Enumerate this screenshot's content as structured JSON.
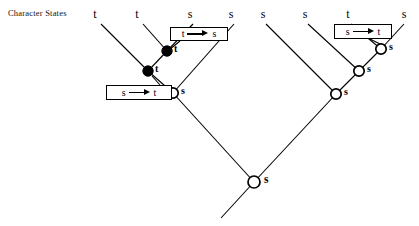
{
  "figure": {
    "width": 419,
    "height": 226,
    "background": "#ffffff",
    "line_color": "#000000",
    "node_filled_color": "#000000",
    "node_open_color": "#ffffff"
  },
  "row_label": {
    "text": "Character States",
    "x": 8,
    "y": 8
  },
  "tips": [
    {
      "id": "tip-1",
      "label": "t",
      "x": 95,
      "y": 7,
      "branch_x": 101,
      "branch_y": 24
    },
    {
      "id": "tip-2",
      "label": "t",
      "x": 137,
      "y": 7,
      "branch_x": 143,
      "branch_y": 24
    },
    {
      "id": "tip-3",
      "label": "s",
      "x": 190,
      "y": 7,
      "branch_x": 193,
      "branch_y": 24
    },
    {
      "id": "tip-4",
      "label": "s",
      "x": 231,
      "y": 7,
      "branch_x": 234,
      "branch_y": 24
    },
    {
      "id": "tip-5",
      "label": "s",
      "x": 263,
      "y": 7,
      "branch_x": 266,
      "branch_y": 24
    },
    {
      "id": "tip-6",
      "label": "s",
      "x": 305,
      "y": 7,
      "branch_x": 308,
      "branch_y": 24
    },
    {
      "id": "tip-7",
      "label": "t",
      "x": 348,
      "y": 7,
      "branch_x": 351,
      "branch_y": 24
    },
    {
      "id": "tip-8",
      "label": "s",
      "x": 404,
      "y": 7,
      "branch_x": 404,
      "branch_y": 24
    }
  ],
  "nodes": [
    {
      "id": "node-a",
      "state": "t",
      "x": 167,
      "y": 51,
      "fill": "filled",
      "radius": 5.2,
      "label_dx": 7,
      "label_dy": 4
    },
    {
      "id": "node-b",
      "state": "t",
      "x": 148,
      "y": 71,
      "fill": "filled",
      "radius": 5.2,
      "label_dx": 7,
      "label_dy": 4
    },
    {
      "id": "node-c",
      "state": "s",
      "x": 173,
      "y": 93,
      "fill": "open",
      "radius": 5.2,
      "label_dx": 8,
      "label_dy": 4
    },
    {
      "id": "node-d",
      "state": "s",
      "x": 381,
      "y": 49,
      "fill": "open",
      "radius": 5.2,
      "label_dx": 8,
      "label_dy": 4
    },
    {
      "id": "node-e",
      "state": "s",
      "x": 359,
      "y": 71,
      "fill": "open",
      "radius": 5.2,
      "label_dx": 8,
      "label_dy": 4
    },
    {
      "id": "node-f",
      "state": "s",
      "x": 336,
      "y": 94,
      "fill": "open",
      "radius": 5.2,
      "label_dx": 8,
      "label_dy": 4
    },
    {
      "id": "node-root",
      "state": "s",
      "x": 254,
      "y": 182,
      "fill": "open",
      "radius": 6.0,
      "label_dx": 10,
      "label_dy": 5
    }
  ],
  "branches": [
    {
      "id": "branch-tip1",
      "x1": 101,
      "y1": 24,
      "x2": 148,
      "y2": 71
    },
    {
      "id": "branch-tip2",
      "x1": 143,
      "y1": 24,
      "x2": 167,
      "y2": 51
    },
    {
      "id": "branch-tip3",
      "x1": 193,
      "y1": 24,
      "x2": 167,
      "y2": 51
    },
    {
      "id": "branch-nodeA-nodeB",
      "x1": 167,
      "y1": 51,
      "x2": 148,
      "y2": 71
    },
    {
      "id": "branch-nodeB-nodeC",
      "x1": 148,
      "y1": 71,
      "x2": 173,
      "y2": 93
    },
    {
      "id": "branch-tip4",
      "x1": 234,
      "y1": 24,
      "x2": 173,
      "y2": 93
    },
    {
      "id": "branch-nodeC-root",
      "x1": 173,
      "y1": 93,
      "x2": 254,
      "y2": 182
    },
    {
      "id": "branch-tip5",
      "x1": 266,
      "y1": 24,
      "x2": 336,
      "y2": 94
    },
    {
      "id": "branch-tip6",
      "x1": 308,
      "y1": 24,
      "x2": 359,
      "y2": 71
    },
    {
      "id": "branch-tip7",
      "x1": 351,
      "y1": 24,
      "x2": 381,
      "y2": 49
    },
    {
      "id": "branch-tip8",
      "x1": 404,
      "y1": 24,
      "x2": 381,
      "y2": 49
    },
    {
      "id": "branch-nodeD-nodeE",
      "x1": 381,
      "y1": 49,
      "x2": 359,
      "y2": 71
    },
    {
      "id": "branch-nodeE-nodeF",
      "x1": 359,
      "y1": 71,
      "x2": 336,
      "y2": 94
    },
    {
      "id": "branch-nodeF-root",
      "x1": 336,
      "y1": 94,
      "x2": 254,
      "y2": 182
    },
    {
      "id": "branch-root-stem",
      "x1": 254,
      "y1": 182,
      "x2": 221,
      "y2": 218
    }
  ],
  "change_boxes": [
    {
      "id": "change-box-1",
      "from": "t",
      "to": "s",
      "arrow": "right-arrow-icon",
      "x": 170,
      "y": 27,
      "width": 58,
      "height": 14,
      "leader": {
        "x1": 180,
        "y1": 41,
        "x2": 169,
        "y2": 50
      }
    },
    {
      "id": "change-box-2",
      "from": "s",
      "to": "t",
      "arrow": "right-arrow-icon",
      "x": 106,
      "y": 85,
      "width": 66,
      "height": 15,
      "leader": {
        "x1": 160,
        "y1": 85,
        "x2": 152,
        "y2": 76
      }
    },
    {
      "id": "change-box-3",
      "from": "s",
      "to": "t",
      "arrow": "right-arrow-icon",
      "x": 334,
      "y": 24,
      "width": 58,
      "height": 15,
      "leader": {
        "x1": 370,
        "y1": 39,
        "x2": 380,
        "y2": 44
      }
    }
  ]
}
